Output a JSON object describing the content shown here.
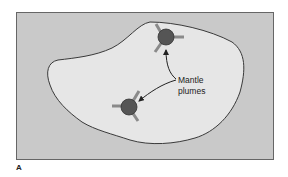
{
  "figure": {
    "panel_label": "A",
    "annotation": {
      "line1": "Mantle",
      "line2": "plumes"
    },
    "elements": {
      "frame": "map-frame",
      "region": "continent-outline",
      "plumes": [
        "plume-top",
        "plume-bottom"
      ],
      "arrows": [
        "arrow-to-top-plume",
        "arrow-to-bottom-plume"
      ]
    },
    "colors": {
      "background": "#c9c9c9",
      "continent_fill": "#e6e6e6",
      "outline": "#3a3a3a",
      "plume_fill": "#555555",
      "rift_arm": "#8a8a8a",
      "text": "#222222"
    }
  }
}
